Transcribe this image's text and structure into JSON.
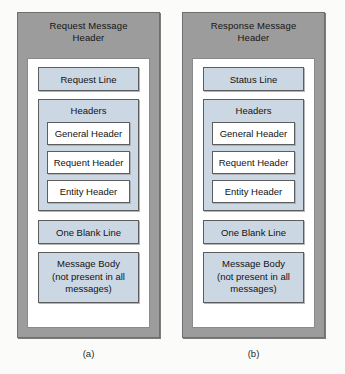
{
  "figure": {
    "panels": [
      {
        "id": "request",
        "title": "Request Message\nHeader",
        "title_line1": "Request Message",
        "title_line2": "Header",
        "first_line_label": "Request Line",
        "headers_label": "Headers",
        "header_items": [
          "General Header",
          "Requent Header",
          "Entity Header"
        ],
        "blank_line_label": "One Blank Line",
        "message_body_line1": "Message Body",
        "message_body_line2": "(not present in all",
        "message_body_line3": "messages)",
        "caption": "(a)"
      },
      {
        "id": "response",
        "title": "Response Message\nHeader",
        "title_line1": "Response Message",
        "title_line2": "Header",
        "first_line_label": "Status Line",
        "headers_label": "Headers",
        "header_items": [
          "General Header",
          "Requent Header",
          "Entity Header"
        ],
        "blank_line_label": "One Blank Line",
        "message_body_line1": "Message Body",
        "message_body_line2": "(not present in all",
        "message_body_line3": "messages)",
        "caption": "(b)"
      }
    ],
    "colors": {
      "frame_gray": "#9c9c9c",
      "frame_border": "#6f6f6f",
      "box_blue": "#ccd7e4",
      "box_border": "#5d5d5d",
      "inner_white": "#ffffff",
      "page_background": "#fbfbfa",
      "text": "#121212"
    }
  }
}
